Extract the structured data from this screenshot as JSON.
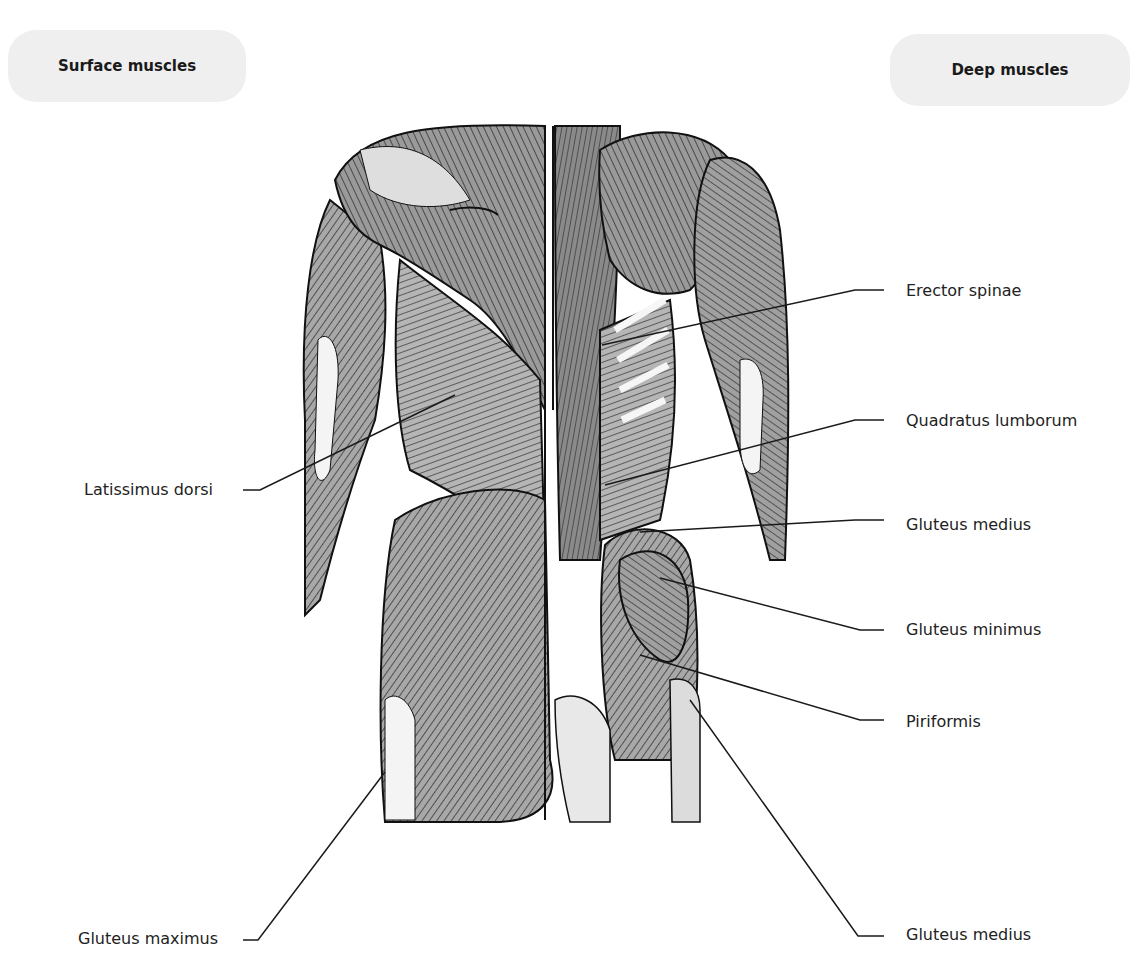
{
  "headings": {
    "left": "Surface muscles",
    "right": "Deep muscles"
  },
  "labels": {
    "left": [
      {
        "text": "Latissimus dorsi"
      },
      {
        "text": "Gluteus maximus"
      }
    ],
    "right": [
      {
        "text": "Erector spinae"
      },
      {
        "text": "Quadratus lumborum"
      },
      {
        "text": "Gluteus medius"
      },
      {
        "text": "Gluteus minimus"
      },
      {
        "text": "Piriformis"
      },
      {
        "text": "Gluteus medius"
      }
    ]
  },
  "colors": {
    "pill_bg": "#efefef",
    "muscle_dark": "#6e6e6e",
    "muscle_mid": "#9a9a9a",
    "muscle_light": "#cfcfcf",
    "leader_line": "#1a1a1a"
  }
}
